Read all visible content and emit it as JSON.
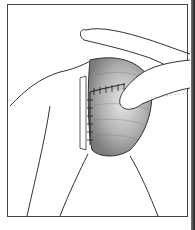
{
  "figure": {
    "colors": {
      "background": "#ffffff",
      "line": "#333333",
      "shading_dark": "#8a8a8a",
      "shading_light": "#e6e6e6",
      "border": "#444444"
    }
  }
}
